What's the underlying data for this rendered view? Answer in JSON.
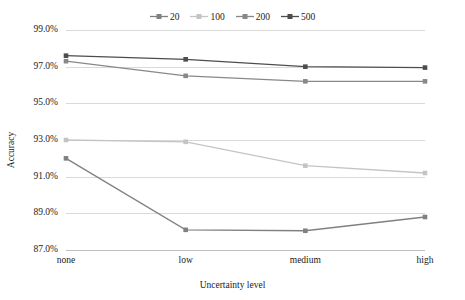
{
  "chart_data": {
    "type": "line",
    "title": "",
    "xlabel": "Uncertainty level",
    "ylabel": "Accuracy",
    "categories": [
      "none",
      "low",
      "medium",
      "high"
    ],
    "ytick_labels": [
      "99.0%",
      "97.0%",
      "95.0%",
      "93.0%",
      "91.0%",
      "89.0%",
      "87.0%"
    ],
    "ytick_values": [
      99.0,
      97.0,
      95.0,
      93.0,
      91.0,
      89.0,
      87.0
    ],
    "ylim": [
      87.0,
      99.0
    ],
    "yunit": "%",
    "grid": true,
    "legend_position": "top-center",
    "series": [
      {
        "name": "20",
        "color": "#808080",
        "marker": "square",
        "values": [
          92.0,
          88.1,
          88.05,
          88.8
        ]
      },
      {
        "name": "100",
        "color": "#c4c4c4",
        "marker": "square",
        "values": [
          93.0,
          92.9,
          91.6,
          91.2
        ]
      },
      {
        "name": "200",
        "color": "#888888",
        "marker": "square",
        "values": [
          97.3,
          96.5,
          96.2,
          96.2
        ]
      },
      {
        "name": "500",
        "color": "#4d4d4d",
        "marker": "square",
        "values": [
          97.6,
          97.4,
          97.0,
          96.95
        ]
      }
    ]
  },
  "legend": {
    "items": [
      {
        "label": "20"
      },
      {
        "label": "100"
      },
      {
        "label": "200"
      },
      {
        "label": "500"
      }
    ]
  },
  "axes": {
    "y_title": "Accuracy",
    "x_title": "Uncertainty level"
  }
}
